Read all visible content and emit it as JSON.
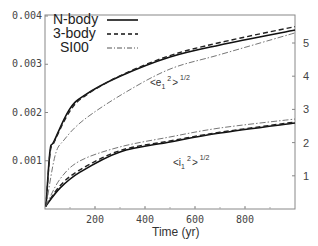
{
  "chart_data": {
    "type": "line",
    "title": "",
    "xlabel": "Time (yr)",
    "ylabel_left": "",
    "ylabel_right": "",
    "xlim": [
      0,
      1000
    ],
    "ylim_left": [
      0,
      0.004
    ],
    "ylim_right": [
      0,
      5.8
    ],
    "x_ticks": [
      200,
      400,
      600,
      800
    ],
    "y_ticks_left": [
      "0.001",
      "0.002",
      "0.003",
      "0.004"
    ],
    "y_ticks_right": [
      "1",
      "2",
      "3",
      "4",
      "5"
    ],
    "grid": false,
    "legend_position": "upper left",
    "legend": [
      {
        "label": "N-body",
        "style": "solid"
      },
      {
        "label": "3-body",
        "style": "dashed"
      },
      {
        "label": "SI00",
        "style": "dash-dot"
      }
    ],
    "annotations": [
      {
        "text": "<e1^2>^1/2",
        "base": "<e",
        "sub": "1",
        "sup": "2",
        "tail": ">",
        "power": "1/2"
      },
      {
        "text": "<i1^2>^1/2",
        "base": "<i",
        "sub": "1",
        "sup": "2",
        "tail": ">",
        "power": "1/2"
      }
    ],
    "series": [
      {
        "name": "N-body",
        "quantity": "<e1^2>^1/2",
        "axis": "left",
        "style": "solid",
        "x": [
          0,
          20,
          36,
          96,
          156,
          300,
          500,
          700,
          1000
        ],
        "values": [
          5e-05,
          0.0012,
          0.0014,
          0.00205,
          0.00235,
          0.00275,
          0.00315,
          0.0034,
          0.00371
        ]
      },
      {
        "name": "3-body",
        "quantity": "<e1^2>^1/2",
        "axis": "left",
        "style": "dashed",
        "x": [
          0,
          20,
          36,
          96,
          156,
          300,
          500,
          700,
          1000
        ],
        "values": [
          5e-05,
          0.00115,
          0.00138,
          0.002,
          0.00233,
          0.00276,
          0.00318,
          0.00345,
          0.00378
        ]
      },
      {
        "name": "SI00",
        "quantity": "<e1^2>^1/2",
        "axis": "left",
        "style": "dash-dot",
        "x": [
          0,
          40,
          76,
          156,
          316,
          500,
          700,
          1000
        ],
        "values": [
          5e-05,
          0.0011,
          0.00143,
          0.00185,
          0.0024,
          0.0029,
          0.0032,
          0.00365
        ]
      },
      {
        "name": "N-body",
        "quantity": "<i1^2>^1/2",
        "axis": "right",
        "style": "solid",
        "x": [
          0,
          60,
          140,
          300,
          500,
          700,
          1000
        ],
        "values": [
          0.1,
          0.63,
          1.11,
          1.72,
          2.02,
          2.29,
          2.59
        ]
      },
      {
        "name": "3-body",
        "quantity": "<i1^2>^1/2",
        "axis": "right",
        "style": "dashed",
        "x": [
          0,
          60,
          140,
          300,
          500,
          700,
          1000
        ],
        "values": [
          0.1,
          0.7,
          1.18,
          1.76,
          2.05,
          2.31,
          2.62
        ]
      },
      {
        "name": "SI00",
        "quantity": "<i1^2>^1/2",
        "axis": "right",
        "style": "dash-dot",
        "x": [
          0,
          60,
          140,
          300,
          500,
          700,
          1000
        ],
        "values": [
          0.1,
          0.9,
          1.45,
          1.87,
          2.17,
          2.44,
          2.71
        ]
      }
    ]
  }
}
